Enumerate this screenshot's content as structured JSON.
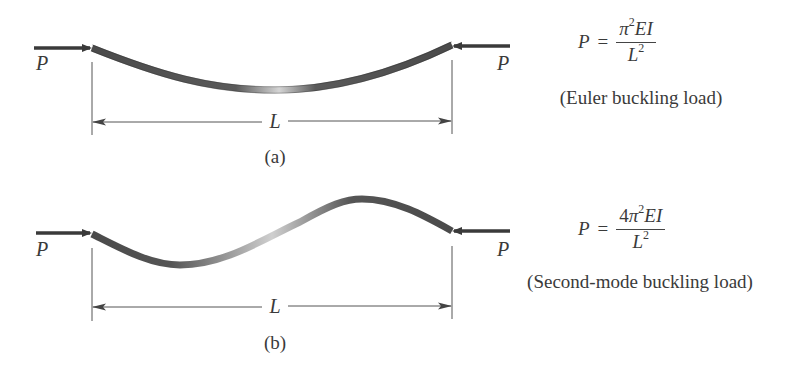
{
  "figure_a": {
    "left_load_label": "P",
    "right_load_label": "P",
    "length_label": "L",
    "subfigure_label": "(a)",
    "formula": {
      "lhs": "P",
      "equals": "=",
      "numerator_coeff": "",
      "numerator_pi": "π",
      "numerator_exp": "2",
      "numerator_rest": "EI",
      "denominator": "L",
      "denominator_exp": "2"
    },
    "caption": "(Euler buckling load)"
  },
  "figure_b": {
    "left_load_label": "P",
    "right_load_label": "P",
    "length_label": "L",
    "subfigure_label": "(b)",
    "formula": {
      "lhs": "P",
      "equals": "=",
      "numerator_coeff": "4",
      "numerator_pi": "π",
      "numerator_exp": "2",
      "numerator_rest": "EI",
      "denominator": "L",
      "denominator_exp": "2"
    },
    "caption": "(Second-mode buckling load)"
  },
  "colors": {
    "beam_dark": "#4a4a4a",
    "beam_light": "#d8d8d8",
    "arrow": "#3a3a3a",
    "line": "#555555",
    "text": "#3a3a3a"
  }
}
